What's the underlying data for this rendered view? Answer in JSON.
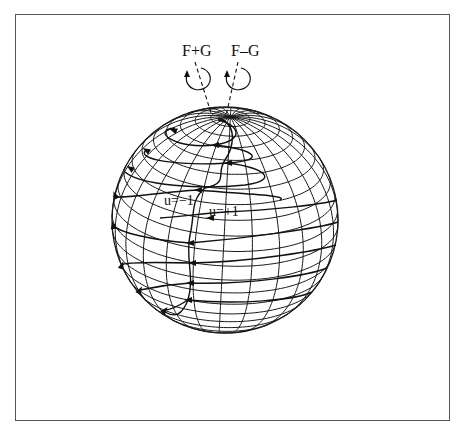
{
  "figure": {
    "frame": {
      "x": 15,
      "y": 14,
      "width": 435,
      "height": 407
    },
    "labels": {
      "f_plus_g": {
        "text": "F+G",
        "x": 182,
        "y": 56,
        "size": 16
      },
      "f_minus_g": {
        "text": "F–G",
        "x": 231,
        "y": 56,
        "size": 16
      },
      "u_minus_1": {
        "text": "u=−1",
        "x": 164,
        "y": 205,
        "size": 14
      },
      "u_plus_1": {
        "text": "u=+1",
        "x": 209,
        "y": 216,
        "size": 14
      }
    },
    "sphere": {
      "cx": 225,
      "cy": 220,
      "r": 113,
      "tilt_deg": 24,
      "rotate_deg": -3,
      "latitude_step_deg": 8,
      "longitude_count": 24,
      "line_color": "#1a1a1a"
    },
    "axes": [
      {
        "name": "F+G",
        "from": [
          195,
          62
        ],
        "to": [
          212,
          116
        ],
        "loop_cx": 199,
        "loop_cy": 79,
        "loop_rx": 12,
        "loop_ry": 11
      },
      {
        "name": "F−G",
        "from": [
          238,
          62
        ],
        "to": [
          226,
          116
        ],
        "loop_cx": 239,
        "loop_cy": 79,
        "loop_rx": 12,
        "loop_ry": 11
      }
    ],
    "trajectories": {
      "spiral_path": "M 218,120 C 240,125 245,140 215,145 C 175,150 150,130 175,128 M 215,145 C 255,150 268,160 228,163 C 180,166 135,160 146,150 M 228,163 C 265,168 280,180 245,185 C 200,190 140,185 125,172 M 198,190 C 240,194 290,195 280,200 M 198,190 C 160,192 118,200 113,196",
      "separatrix_path": "M 218,118 C 240,125 232,150 225,160 C 215,175 230,182 205,188 C 190,200 195,215 190,235 C 185,260 195,275 188,300 C 182,315 175,318 165,312",
      "lower_loops": "M 190,243 C 250,238 320,228 338,222 M 190,243 C 150,240 118,232 113,225 M 190,263 C 255,262 320,250 336,245 M 190,263 C 150,262 125,262 121,265 M 190,283 C 250,285 310,275 327,268 M 190,283 C 160,285 142,290 140,290 M 188,300 C 240,305 295,300 312,292 M 188,300 C 180,305 170,310 165,310 M 225,212 C 270,210 320,205 337,200 M 225,212 C 200,214 175,217 160,218",
      "arrows": [
        {
          "x": 173,
          "y": 130,
          "angle": 200
        },
        {
          "x": 215,
          "y": 145,
          "angle": 180
        },
        {
          "x": 228,
          "y": 163,
          "angle": 180
        },
        {
          "x": 198,
          "y": 190,
          "angle": 180
        },
        {
          "x": 146,
          "y": 150,
          "angle": 210
        },
        {
          "x": 130,
          "y": 168,
          "angle": 215
        },
        {
          "x": 115,
          "y": 195,
          "angle": 245
        },
        {
          "x": 113,
          "y": 225,
          "angle": 260
        },
        {
          "x": 122,
          "y": 265,
          "angle": 290
        },
        {
          "x": 140,
          "y": 290,
          "angle": 300
        },
        {
          "x": 165,
          "y": 310,
          "angle": 310
        },
        {
          "x": 210,
          "y": 218,
          "angle": 180
        },
        {
          "x": 190,
          "y": 243,
          "angle": 180
        },
        {
          "x": 192,
          "y": 263,
          "angle": 180
        },
        {
          "x": 190,
          "y": 283,
          "angle": 180
        },
        {
          "x": 188,
          "y": 300,
          "angle": 180
        }
      ]
    }
  }
}
